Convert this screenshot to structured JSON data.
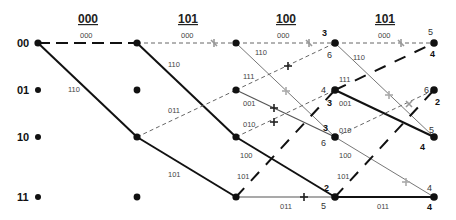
{
  "diagram": {
    "type": "viterbi-trellis",
    "received_sequence": [
      "000",
      "101",
      "100",
      "101"
    ],
    "states": [
      "00",
      "01",
      "10",
      "11"
    ],
    "columns_x": [
      38,
      137,
      236,
      335,
      434
    ],
    "rows_y": [
      43,
      90,
      137,
      197
    ],
    "branches": [
      {
        "from": [
          0,
          0
        ],
        "to": [
          1,
          0
        ],
        "label": "000",
        "style": "survivor-dashed"
      },
      {
        "from": [
          0,
          0
        ],
        "to": [
          1,
          2
        ],
        "label": "110",
        "style": "survivor-solid"
      },
      {
        "from": [
          1,
          0
        ],
        "to": [
          2,
          0
        ],
        "label": "000",
        "style": "dashed-cut"
      },
      {
        "from": [
          1,
          0
        ],
        "to": [
          2,
          2
        ],
        "label": "110",
        "style": "survivor-solid"
      },
      {
        "from": [
          1,
          2
        ],
        "to": [
          2,
          1
        ],
        "label": "011",
        "style": "dashed"
      },
      {
        "from": [
          1,
          2
        ],
        "to": [
          2,
          3
        ],
        "label": "101",
        "style": "survivor-solid"
      },
      {
        "from": [
          2,
          0
        ],
        "to": [
          3,
          0
        ],
        "label": "000",
        "style": "dashed-cut"
      },
      {
        "from": [
          2,
          0
        ],
        "to": [
          3,
          2
        ],
        "label": "110",
        "style": "thin-cut"
      },
      {
        "from": [
          2,
          1
        ],
        "to": [
          3,
          0
        ],
        "label": "111",
        "style": "dashed-cut"
      },
      {
        "from": [
          2,
          1
        ],
        "to": [
          3,
          2
        ],
        "label": "001",
        "style": "thin-cut"
      },
      {
        "from": [
          2,
          2
        ],
        "to": [
          3,
          1
        ],
        "label": "010",
        "style": "dashed-cut"
      },
      {
        "from": [
          2,
          2
        ],
        "to": [
          3,
          3
        ],
        "label": "100",
        "style": "survivor-solid"
      },
      {
        "from": [
          2,
          3
        ],
        "to": [
          3,
          1
        ],
        "label": "101",
        "style": "survivor-longdash"
      },
      {
        "from": [
          2,
          3
        ],
        "to": [
          3,
          3
        ],
        "label": "011",
        "style": "thin-cut"
      },
      {
        "from": [
          3,
          0
        ],
        "to": [
          4,
          0
        ],
        "label": "000",
        "style": "dashed-cut"
      },
      {
        "from": [
          3,
          0
        ],
        "to": [
          4,
          2
        ],
        "label": "110",
        "style": "thin-cut"
      },
      {
        "from": [
          3,
          1
        ],
        "to": [
          4,
          0
        ],
        "label": "111",
        "style": "survivor-longdash"
      },
      {
        "from": [
          3,
          1
        ],
        "to": [
          4,
          2
        ],
        "label": "001",
        "style": "survivor-solid"
      },
      {
        "from": [
          3,
          2
        ],
        "to": [
          4,
          1
        ],
        "label": "010",
        "style": "dashed-cut"
      },
      {
        "from": [
          3,
          2
        ],
        "to": [
          4,
          3
        ],
        "label": "100",
        "style": "thin-cut"
      },
      {
        "from": [
          3,
          3
        ],
        "to": [
          4,
          1
        ],
        "label": "101",
        "style": "survivor-longdash"
      },
      {
        "from": [
          3,
          3
        ],
        "to": [
          4,
          3
        ],
        "label": "011",
        "style": "survivor-solid"
      }
    ],
    "path_metrics": {
      "col3": {
        "00": [
          "3",
          "6"
        ],
        "01": [
          "4",
          "3"
        ],
        "10": [
          "3",
          "6"
        ],
        "11": [
          "2",
          "5"
        ]
      },
      "col4": {
        "00": [
          "5",
          "4"
        ],
        "01": [
          "6",
          "2"
        ],
        "10": [
          "5",
          "4"
        ],
        "11": [
          "4",
          "4"
        ]
      }
    }
  }
}
